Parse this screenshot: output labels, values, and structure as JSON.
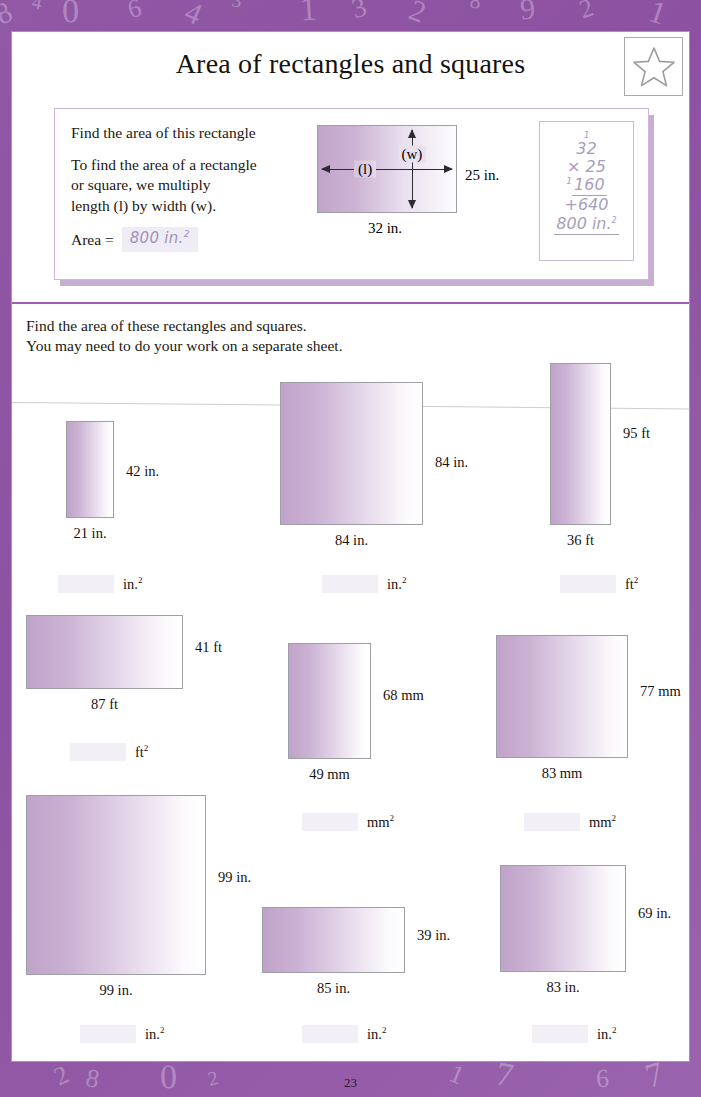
{
  "page": {
    "title": "Area of rectangles and squares",
    "page_number": "23",
    "star_icon": "star-icon",
    "border_color": "#8c52a1",
    "shape_fill_start": "#c0a3c9",
    "shape_fill_end": "#ffffff",
    "divider_color": "#9a5fae"
  },
  "example": {
    "prompt": "Find the area of this rectangle",
    "rule_line1": "To find the area of a rectangle",
    "rule_line2": "or square, we multiply",
    "rule_line3": "length (l) by width (w).",
    "area_label": "Area =",
    "area_value": "800 in.",
    "area_exponent": "2",
    "diagram": {
      "length_marker": "(l)",
      "width_marker": "(w)",
      "side_label": "25 in.",
      "bottom_label": "32 in."
    },
    "calculation": {
      "carry_top": "1",
      "multiplicand": "32",
      "multiplier": "× 25",
      "carry_mid": "1",
      "partial_1": "160",
      "partial_2": "+640",
      "total": "800 in.",
      "total_exponent": "2"
    }
  },
  "instructions": {
    "line1": "Find the area of these rectangles and squares.",
    "line2": "You may need to do your work on a separate sheet."
  },
  "problems": [
    {
      "id": 1,
      "width_label": "21 in.",
      "height_label": "42 in.",
      "unit": "in.",
      "unit_exponent": "2",
      "answer": "",
      "box_w": 48,
      "box_h": 97
    },
    {
      "id": 2,
      "width_label": "84 in.",
      "height_label": "84 in.",
      "unit": "in.",
      "unit_exponent": "2",
      "answer": "",
      "box_w": 143,
      "box_h": 143
    },
    {
      "id": 3,
      "width_label": "36 ft",
      "height_label": "95 ft",
      "unit": "ft",
      "unit_exponent": "2",
      "answer": "",
      "box_w": 61,
      "box_h": 162
    },
    {
      "id": 4,
      "width_label": "87 ft",
      "height_label": "41 ft",
      "unit": "ft",
      "unit_exponent": "2",
      "answer": "",
      "box_w": 157,
      "box_h": 74
    },
    {
      "id": 5,
      "width_label": "49 mm",
      "height_label": "68 mm",
      "unit": "mm",
      "unit_exponent": "2",
      "answer": "",
      "box_w": 83,
      "box_h": 116
    },
    {
      "id": 6,
      "width_label": "83 mm",
      "height_label": "77 mm",
      "unit": "mm",
      "unit_exponent": "2",
      "answer": "",
      "box_w": 132,
      "box_h": 123
    },
    {
      "id": 7,
      "width_label": "99 in.",
      "height_label": "99 in.",
      "unit": "in.",
      "unit_exponent": "2",
      "answer": "",
      "box_w": 180,
      "box_h": 180
    },
    {
      "id": 8,
      "width_label": "85 in.",
      "height_label": "39 in.",
      "unit": "in.",
      "unit_exponent": "2",
      "answer": "",
      "box_w": 143,
      "box_h": 66
    },
    {
      "id": 9,
      "width_label": "83 in.",
      "height_label": "69 in.",
      "unit": "in.",
      "unit_exponent": "2",
      "answer": "",
      "box_w": 126,
      "box_h": 107
    }
  ],
  "decoration": {
    "top_numbers": [
      "8",
      "4",
      "0",
      "6",
      "4",
      "3",
      "1",
      "3",
      "2",
      "8",
      "9",
      "2",
      "1"
    ],
    "bottom_numbers": [
      "2",
      "8",
      "0",
      "2",
      "1",
      "7",
      "6",
      "7"
    ],
    "right_numbers": [
      "1",
      "6",
      "0",
      "4",
      "6",
      "5",
      "9"
    ],
    "left_numbers": [
      "0",
      "3"
    ]
  }
}
